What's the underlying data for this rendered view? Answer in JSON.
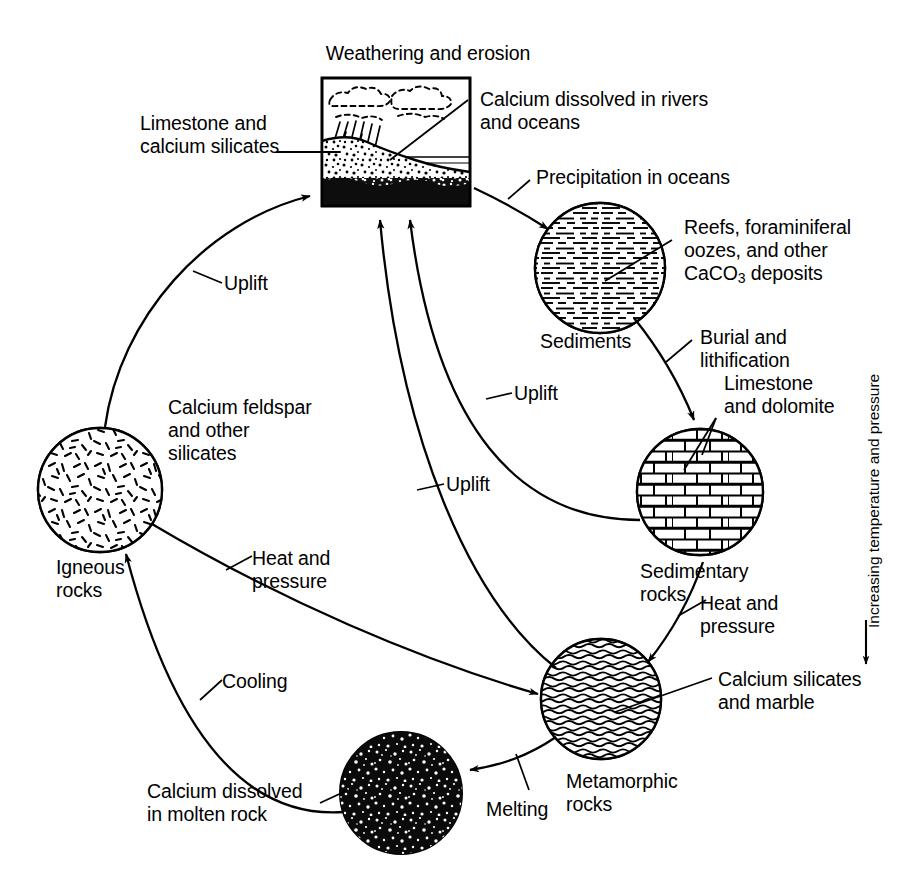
{
  "figure": {
    "background_color": "#ffffff",
    "ink_color": "#000000"
  },
  "nodes": {
    "weathering": {
      "label": "Weathering and erosion",
      "type": "scene-box",
      "description": "clouds, rain, eroding mountain slope, ocean, dark sediment layer"
    },
    "sediments": {
      "label": "Sediments",
      "type": "circle",
      "texture": "horizontal dashed strata"
    },
    "sedimentary": {
      "label_line1": "Sedimentary",
      "label_line2": "rocks",
      "type": "circle",
      "texture": "brick / masonry courses"
    },
    "metamorphic": {
      "label_line1": "Metamorphic",
      "label_line2": "rocks",
      "type": "circle",
      "texture": "wavy foliation"
    },
    "molten": {
      "label": "",
      "type": "circle",
      "texture": "dense black speckle"
    },
    "igneous": {
      "label_line1": "Igneous",
      "label_line2": "rocks",
      "type": "circle",
      "texture": "random short dashes (crystals)"
    }
  },
  "callouts": {
    "limestone_and_calcium_silicates": "Limestone and\ncalcium silicates",
    "calcium_dissolved_rivers_oceans": "Calcium dissolved in rivers\nand oceans",
    "reefs_forams": "Reefs, foraminiferal\noozes, and other",
    "reefs_forams_last_pre": "CaCO",
    "reefs_forams_sub": "3",
    "reefs_forams_last_post": " deposits",
    "limestone_and_dolomite": "Limestone\nand dolomite",
    "calcium_feldspar_and_other_silicates": "Calcium feldspar\nand other\nsilicates",
    "calcium_silicates_and_marble": "Calcium silicates\nand marble",
    "calcium_dissolved_in_molten_rock": "Calcium dissolved\nin molten rock"
  },
  "processes": {
    "uplift_left": "Uplift",
    "uplift_mid_upper": "Uplift",
    "uplift_mid_lower": "Uplift",
    "precipitation_in_oceans": "Precipitation in oceans",
    "burial_and_lithification": "Burial and\nlithification",
    "heat_and_pressure_right": "Heat and\npressure",
    "heat_and_pressure_left": "Heat and\npressure",
    "cooling": "Cooling",
    "melting": "Melting"
  },
  "axis": {
    "vertical_label": "Increasing temperature and pressure",
    "direction": "downward arrow"
  }
}
